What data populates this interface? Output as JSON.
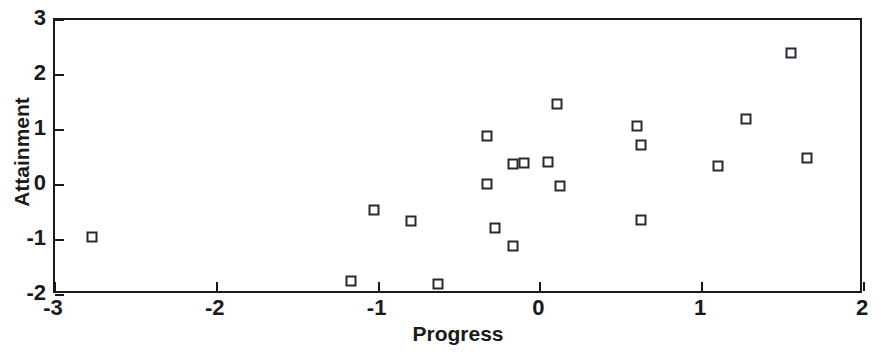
{
  "chart_data": {
    "type": "scatter",
    "title": "",
    "xlabel": "Progress",
    "ylabel": "Attainment",
    "xlim": [
      -3,
      2
    ],
    "ylim": [
      -2,
      3
    ],
    "xticks": [
      -3,
      -2,
      -1,
      0,
      1,
      2
    ],
    "yticks": [
      -2,
      -1,
      0,
      1,
      2,
      3
    ],
    "xticklabels": [
      "-3",
      "-2",
      "-1",
      "0",
      "1",
      "2"
    ],
    "yticklabels": [
      "-2",
      "-1",
      "0",
      "1",
      "2",
      "3"
    ],
    "grid": false,
    "legend": null,
    "marker": "open-square",
    "marker_color": "#2a2a33",
    "n_points": 21,
    "points": [
      {
        "x": -2.77,
        "y": -0.95
      },
      {
        "x": -1.17,
        "y": -1.75
      },
      {
        "x": -1.03,
        "y": -0.45
      },
      {
        "x": -0.8,
        "y": -0.65
      },
      {
        "x": -0.63,
        "y": -1.8
      },
      {
        "x": -0.33,
        "y": 0.9
      },
      {
        "x": -0.33,
        "y": 0.02
      },
      {
        "x": -0.28,
        "y": -0.78
      },
      {
        "x": -0.17,
        "y": 0.38
      },
      {
        "x": -0.17,
        "y": -1.1
      },
      {
        "x": 0.05,
        "y": 0.42
      },
      {
        "x": 0.1,
        "y": 1.48
      },
      {
        "x": 0.12,
        "y": -0.02
      },
      {
        "x": 0.6,
        "y": 1.08
      },
      {
        "x": 0.62,
        "y": 0.72
      },
      {
        "x": 0.62,
        "y": -0.63
      },
      {
        "x": 1.1,
        "y": 0.35
      },
      {
        "x": 1.27,
        "y": 1.2
      },
      {
        "x": 1.55,
        "y": 2.4
      },
      {
        "x": 1.65,
        "y": 0.5
      },
      {
        "x": -0.1,
        "y": 0.4
      }
    ]
  }
}
